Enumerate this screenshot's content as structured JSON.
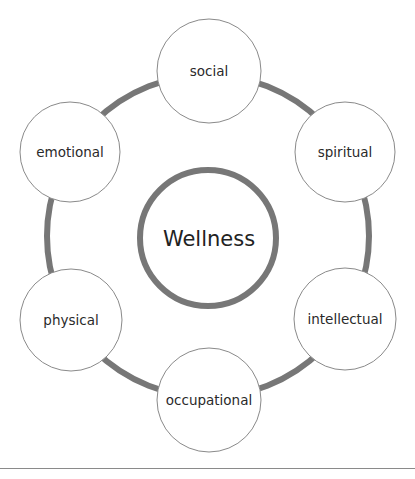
{
  "diagram": {
    "title": "Wellness",
    "colors": {
      "ring": "#777777",
      "node_outline": "#8a8a8a",
      "node_fill": "#ffffff",
      "text": "#222222"
    },
    "nodes": [
      {
        "label": "social"
      },
      {
        "label": "spiritual"
      },
      {
        "label": "intellectual"
      },
      {
        "label": "occupational"
      },
      {
        "label": "physical"
      },
      {
        "label": "emotional"
      }
    ]
  },
  "caption": {
    "top_fragment": "",
    "bottom_fragment": ""
  }
}
